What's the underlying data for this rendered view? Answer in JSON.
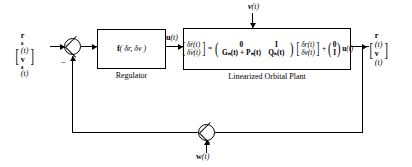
{
  "diagram": {
    "reference_input": {
      "name": "reference-state-vector",
      "row1_symbol": "r",
      "row1_subscript": "a",
      "row1_arg": "(t)",
      "row2_symbol": "v",
      "row2_subscript": "a",
      "row2_arg": "(t)",
      "left_bracket": "[",
      "right_bracket": "]"
    },
    "error_sum": {
      "name": "error-summing-junction",
      "feedback_sign": "–"
    },
    "regulator": {
      "name": "regulator-block",
      "expression_f": "f",
      "expression_args": "( δr, δv )",
      "caption": "Regulator",
      "output_signal": "u",
      "output_arg": "(t)"
    },
    "plant": {
      "name": "linearized-orbital-plant-block",
      "caption": "Linearized Orbital Plant",
      "disturbance_input": {
        "symbol": "v",
        "arg": "(t)"
      },
      "equation": {
        "lhs": {
          "left_bracket": "[",
          "right_bracket": "]",
          "row1": "δṙ(t)",
          "row2": "δv̇(t)"
        },
        "equals": "=",
        "matrix": {
          "left_paren": "(",
          "right_paren": ")",
          "r1c1": "0",
          "r1c2": "I",
          "r2c1": "Gₙ(t) + Pₙ(t)",
          "r2c2": "Qₙ(t)"
        },
        "state": {
          "left_bracket": "[",
          "right_bracket": "]",
          "row1": "δr(t)",
          "row2": "δv(t)"
        },
        "plus": "+",
        "input_matrix": {
          "left_paren": "(",
          "right_paren": ")",
          "row1": "0",
          "row2": "I"
        },
        "input_signal": "u",
        "input_arg": "(t)"
      }
    },
    "output": {
      "name": "output-state-vector",
      "left_bracket": "[",
      "right_bracket": "]",
      "row1_symbol": "r",
      "row1_arg": "(t)",
      "row2_symbol": "v",
      "row2_arg": "(t)"
    },
    "noise_sum": {
      "name": "measurement-noise-summing-junction",
      "noise_symbol": "w",
      "noise_arg": "(t)"
    },
    "colors": {
      "line": "#000000",
      "background": "#ffffff"
    }
  }
}
